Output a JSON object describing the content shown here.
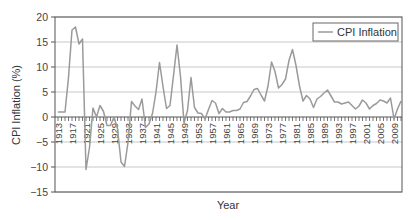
{
  "chart_data": {
    "type": "line",
    "title": "",
    "xlabel": "Year",
    "ylabel": "CPI Inflation (%)",
    "ylim": [
      -15,
      20
    ],
    "yticks": [
      20,
      15,
      10,
      5,
      0,
      -5,
      -10,
      -15
    ],
    "ytick_labels": [
      "20",
      "15",
      "10",
      "5",
      "0",
      "−5",
      "−10",
      "−15"
    ],
    "xlim": [
      1913,
      2011
    ],
    "xtick_labels": [
      "1913",
      "1917",
      "1921",
      "1925",
      "1929",
      "1933",
      "1937",
      "1941",
      "1945",
      "1949",
      "1953",
      "1957",
      "1961",
      "1965",
      "1969",
      "1973",
      "1977",
      "1981",
      "1985",
      "1989",
      "1993",
      "1997",
      "2001",
      "2005",
      "2009"
    ],
    "grid": true,
    "legend": {
      "position": "top-right",
      "entries": [
        "CPI Inflation"
      ]
    },
    "series": [
      {
        "name": "CPI Inflation",
        "color": "#9a9a9a",
        "x": [
          1913,
          1914,
          1915,
          1916,
          1917,
          1918,
          1919,
          1920,
          1921,
          1922,
          1923,
          1924,
          1925,
          1926,
          1927,
          1928,
          1929,
          1930,
          1931,
          1932,
          1933,
          1934,
          1935,
          1936,
          1937,
          1938,
          1939,
          1940,
          1941,
          1942,
          1943,
          1944,
          1945,
          1946,
          1947,
          1948,
          1949,
          1950,
          1951,
          1952,
          1953,
          1954,
          1955,
          1956,
          1957,
          1958,
          1959,
          1960,
          1961,
          1962,
          1963,
          1964,
          1965,
          1966,
          1967,
          1968,
          1969,
          1970,
          1971,
          1972,
          1973,
          1974,
          1975,
          1976,
          1977,
          1978,
          1979,
          1980,
          1981,
          1982,
          1983,
          1984,
          1985,
          1986,
          1987,
          1988,
          1989,
          1990,
          1991,
          1992,
          1993,
          1994,
          1995,
          1996,
          1997,
          1998,
          1999,
          2000,
          2001,
          2002,
          2003,
          2004,
          2005,
          2006,
          2007,
          2008,
          2009,
          2010,
          2011
        ],
        "values": [
          1.0,
          1.0,
          1.0,
          7.9,
          17.4,
          18.0,
          14.6,
          15.6,
          -10.5,
          -6.1,
          1.8,
          0.0,
          2.3,
          1.1,
          -1.7,
          -1.7,
          0.0,
          -2.3,
          -9.0,
          -9.9,
          -5.1,
          3.1,
          2.2,
          1.5,
          3.6,
          -2.1,
          -1.4,
          0.7,
          5.0,
          10.9,
          6.1,
          1.7,
          2.3,
          8.3,
          14.4,
          8.1,
          -1.2,
          1.3,
          7.9,
          1.9,
          0.8,
          0.7,
          -0.4,
          1.5,
          3.3,
          2.8,
          0.7,
          1.7,
          1.0,
          1.0,
          1.3,
          1.3,
          1.6,
          2.9,
          3.1,
          4.2,
          5.5,
          5.7,
          4.4,
          3.2,
          6.2,
          11.0,
          9.1,
          5.8,
          6.5,
          7.6,
          11.3,
          13.5,
          10.3,
          6.2,
          3.2,
          4.3,
          3.6,
          1.9,
          3.6,
          4.1,
          4.8,
          5.4,
          4.2,
          3.0,
          3.0,
          2.6,
          2.8,
          3.0,
          2.3,
          1.6,
          2.2,
          3.4,
          2.8,
          1.6,
          2.3,
          2.7,
          3.4,
          3.2,
          2.8,
          3.8,
          -0.4,
          1.6,
          3.2
        ]
      }
    ]
  }
}
